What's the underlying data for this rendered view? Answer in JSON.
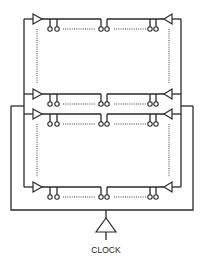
{
  "diagram": {
    "clock_label": "CLOCK",
    "groups": [
      {
        "name": "upper",
        "rows": [
          "top",
          "middle"
        ]
      },
      {
        "name": "lower",
        "rows": [
          "middle",
          "bottom"
        ]
      }
    ],
    "row_count": 4,
    "pin_pairs_per_row": 3,
    "buffers_per_row": 2,
    "colors": {
      "line": "#2a2a2a",
      "background": "#ffffff"
    }
  }
}
